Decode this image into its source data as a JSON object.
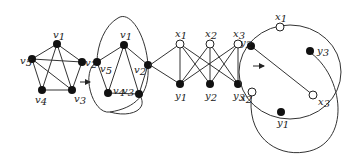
{
  "diagram": {
    "stage1": {
      "vertices": [
        {
          "id": "v1",
          "label": "v",
          "sub": "1",
          "x": 57,
          "y": 44,
          "filled": true
        },
        {
          "id": "v2",
          "label": "v",
          "sub": "2",
          "x": 82,
          "y": 62,
          "filled": true
        },
        {
          "id": "v3",
          "label": "v",
          "sub": "3",
          "x": 72,
          "y": 90,
          "filled": true
        },
        {
          "id": "v4",
          "label": "v",
          "sub": "4",
          "x": 42,
          "y": 90,
          "filled": true
        },
        {
          "id": "v5",
          "label": "v",
          "sub": "5",
          "x": 32,
          "y": 59,
          "filled": true
        }
      ],
      "edges": [
        [
          "v1",
          "v2"
        ],
        [
          "v2",
          "v3"
        ],
        [
          "v3",
          "v4"
        ],
        [
          "v4",
          "v5"
        ],
        [
          "v5",
          "v1"
        ],
        [
          "v1",
          "v3"
        ],
        [
          "v1",
          "v4"
        ],
        [
          "v5",
          "v2"
        ],
        [
          "v5",
          "v3"
        ]
      ]
    },
    "stage2": {
      "vertices": [
        {
          "id": "v1",
          "label": "v",
          "sub": "1",
          "x": 124,
          "y": 45,
          "filled": true
        },
        {
          "id": "v2",
          "label": "v",
          "sub": "2",
          "x": 148,
          "y": 65,
          "filled": true
        },
        {
          "id": "v3",
          "label": "v",
          "sub": "3",
          "x": 139,
          "y": 94,
          "filled": true
        },
        {
          "id": "v4",
          "label": "v",
          "sub": "4",
          "x": 108,
          "y": 93,
          "filled": true
        },
        {
          "id": "v5",
          "label": "v",
          "sub": "5",
          "x": 97,
          "y": 62,
          "filled": true
        }
      ],
      "edges": [
        [
          "v1",
          "v2"
        ],
        [
          "v2",
          "v3"
        ],
        [
          "v3",
          "v4"
        ],
        [
          "v4",
          "v5"
        ],
        [
          "v5",
          "v1"
        ],
        [
          "v1",
          "v3"
        ],
        [
          "v1",
          "v4"
        ]
      ]
    },
    "stage3": {
      "vertices": [
        {
          "id": "x1",
          "label": "x",
          "sub": "1",
          "x": 170,
          "y": 53,
          "filled": false
        },
        {
          "id": "x2",
          "label": "x",
          "sub": "2",
          "x": 208,
          "y": 53,
          "filled": false
        },
        {
          "id": "x3",
          "label": "x",
          "sub": "3",
          "x": 240,
          "y": 53,
          "filled": false
        },
        {
          "id": "y1",
          "label": "y",
          "sub": "1",
          "x": 170,
          "y": 92,
          "filled": true
        },
        {
          "id": "y2",
          "label": "y",
          "sub": "2",
          "x": 208,
          "y": 92,
          "filled": true
        },
        {
          "id": "y3",
          "label": "y",
          "sub": "3",
          "x": 240,
          "y": 92,
          "filled": true
        }
      ],
      "edges": [
        [
          "x1",
          "y1"
        ],
        [
          "x1",
          "y2"
        ],
        [
          "x1",
          "y3"
        ],
        [
          "x2",
          "y1"
        ],
        [
          "x2",
          "y2"
        ],
        [
          "x2",
          "y3"
        ],
        [
          "x3",
          "y1"
        ],
        [
          "x3",
          "y2"
        ],
        [
          "x3",
          "y3"
        ]
      ]
    },
    "stage4": {
      "vertices": [
        {
          "id": "x1",
          "label": "x",
          "sub": "1",
          "x": 277,
          "y": 27,
          "filled": false
        },
        {
          "id": "y3",
          "label": "y",
          "sub": "3",
          "x": 310,
          "y": 50,
          "filled": true
        },
        {
          "id": "x3",
          "label": "x",
          "sub": "3",
          "x": 307,
          "y": 94,
          "filled": false
        },
        {
          "id": "y1",
          "label": "y",
          "sub": "1",
          "x": 270,
          "y": 112,
          "filled": true
        },
        {
          "id": "x2",
          "label": "x",
          "sub": "2",
          "x": 236,
          "y": 89,
          "filled": false
        },
        {
          "id": "y2",
          "label": "y",
          "sub": "2",
          "x": 238,
          "y": 45,
          "filled": true
        }
      ]
    },
    "arrows": [
      {
        "from_x": 79,
        "to_x": 90,
        "y": 81
      },
      {
        "from_x": 253,
        "to_x": 264,
        "y": 75
      }
    ]
  }
}
